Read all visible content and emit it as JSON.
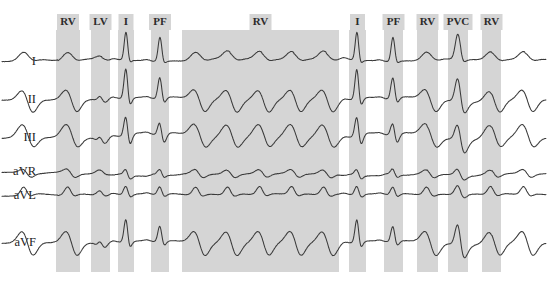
{
  "figure": {
    "background_color": "#ffffff",
    "band_color": "#d5d5d5",
    "trace_color": "#3a3a3a",
    "label_color": "#1c1c1c"
  },
  "leads": [
    {
      "label": "I",
      "y": 62,
      "label_x": 36
    },
    {
      "label": "II",
      "y": 100,
      "label_x": 36
    },
    {
      "label": "III",
      "y": 138,
      "label_x": 36
    },
    {
      "label": "aVR",
      "y": 172,
      "label_x": 36
    },
    {
      "label": "aVL",
      "y": 196,
      "label_x": 36
    },
    {
      "label": "aVF",
      "y": 243,
      "label_x": 36
    }
  ],
  "bands": [
    {
      "label": "RV",
      "x": 56,
      "width": 24
    },
    {
      "label": "LV",
      "x": 91,
      "width": 19
    },
    {
      "label": "I",
      "x": 118,
      "width": 16
    },
    {
      "label": "PF",
      "x": 151,
      "width": 18
    },
    {
      "label": "RV",
      "x": 182,
      "width": 157
    },
    {
      "label": "I",
      "x": 349,
      "width": 17
    },
    {
      "label": "PF",
      "x": 384,
      "width": 19
    },
    {
      "label": "RV",
      "x": 417,
      "width": 21
    },
    {
      "label": "PVC",
      "x": 448,
      "width": 20
    },
    {
      "label": "RV",
      "x": 482,
      "width": 19
    }
  ],
  "band_label_y": 22,
  "plot": {
    "x_start": 46,
    "x_end": 524,
    "y_top": 30,
    "y_bottom": 272
  },
  "chart_data": {
    "type": "line",
    "xlabel": "time",
    "ylabel": "amplitude (mV)",
    "grid": false,
    "legend": "none",
    "annotations": [
      "RV",
      "LV",
      "I",
      "PF",
      "RV",
      "I",
      "PF",
      "RV",
      "PVC",
      "RV"
    ],
    "series": [
      {
        "name": "I",
        "values": []
      },
      {
        "name": "II",
        "values": []
      },
      {
        "name": "III",
        "values": []
      },
      {
        "name": "aVR",
        "values": []
      },
      {
        "name": "aVL",
        "values": []
      },
      {
        "name": "aVF",
        "values": []
      }
    ],
    "beat_events": [
      {
        "label": "RV",
        "center_x": 68
      },
      {
        "label": "LV",
        "center_x": 100
      },
      {
        "label": "I",
        "center_x": 126
      },
      {
        "label": "PF",
        "center_x": 160
      },
      {
        "label": "RV",
        "center_x": 260
      },
      {
        "label": "I",
        "center_x": 357
      },
      {
        "label": "PF",
        "center_x": 393
      },
      {
        "label": "RV",
        "center_x": 427
      },
      {
        "label": "PVC",
        "center_x": 458
      },
      {
        "label": "RV",
        "center_x": 491
      }
    ]
  }
}
